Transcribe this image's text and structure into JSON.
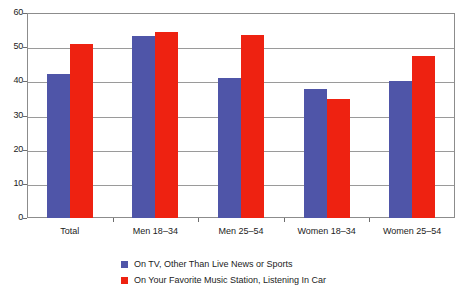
{
  "chart_data": {
    "type": "bar",
    "title": "",
    "subtitle": "",
    "xlabel": "",
    "ylabel": "",
    "ylim": [
      0,
      60
    ],
    "yticks": [
      0,
      10,
      20,
      30,
      40,
      50,
      60
    ],
    "ytick_labels": [
      "0",
      "10",
      "20",
      "30",
      "40",
      "50",
      "60"
    ],
    "grid": true,
    "legend_position": "bottom",
    "categories": [
      "Total",
      "Men 18–34",
      "Men 25–54",
      "Women 18–34",
      "Women 25–54"
    ],
    "series": [
      {
        "name": "On TV, Other Than Live News or Sports",
        "color": "#4F55A8",
        "values": [
          42.1,
          53.2,
          41.0,
          37.7,
          40.1
        ]
      },
      {
        "name": "On Your Favorite Music Station, Listening In Car",
        "color": "#EE2211",
        "values": [
          50.9,
          54.5,
          53.6,
          34.8,
          47.5
        ]
      }
    ]
  },
  "legend": {
    "items": [
      {
        "label": "On TV, Other Than Live News or Sports",
        "color": "#4F55A8"
      },
      {
        "label": "On Your Favorite Music Station, Listening In Car",
        "color": "#EE2211"
      }
    ]
  },
  "colors": {
    "series_blue": "#4F55A8",
    "series_red": "#EE2211",
    "axis": "#8C8C8C",
    "gridline": "#9A9A9A",
    "text": "#1C1C1C",
    "background": "#FFFFFF"
  }
}
